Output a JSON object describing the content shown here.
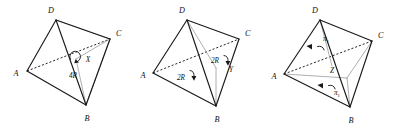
{
  "figure": {
    "caption": "",
    "background_color": "#ffffff",
    "line_color": "#1a1a1a",
    "light_line_color": "#9a9a9a",
    "count": 3
  },
  "panels": [
    {
      "id": "panel-1",
      "vertices": [
        {
          "name": "A",
          "label": "A"
        },
        {
          "name": "B",
          "label": "B"
        },
        {
          "name": "C",
          "label": "C"
        },
        {
          "name": "D",
          "label": "D"
        }
      ],
      "marked_point": "X",
      "rotation_labels": [
        {
          "text": "4R",
          "symbol": "circular-arrow",
          "turn": "full"
        }
      ]
    },
    {
      "id": "panel-2",
      "vertices": [
        {
          "name": "A",
          "label": "A"
        },
        {
          "name": "B",
          "label": "B"
        },
        {
          "name": "C",
          "label": "C"
        },
        {
          "name": "D",
          "label": "D"
        }
      ],
      "marked_point": "Y",
      "rotation_labels": [
        {
          "text": "2R",
          "symbol": "curved-arrow",
          "turn": "half"
        },
        {
          "text": "2R",
          "symbol": "curved-arrow",
          "turn": "half"
        }
      ]
    },
    {
      "id": "panel-3",
      "vertices": [
        {
          "name": "A",
          "label": "A"
        },
        {
          "name": "B",
          "label": "B"
        },
        {
          "name": "C",
          "label": "C"
        },
        {
          "name": "D",
          "label": "D"
        }
      ],
      "marked_point": "Z",
      "rotation_labels": [
        {
          "base": "π",
          "sub": "1",
          "symbol": "curved-arrow-with-tick"
        },
        {
          "base": "π",
          "sub": "1",
          "symbol": "curved-arrow-with-tick"
        }
      ]
    }
  ],
  "labels": {
    "A": "A",
    "B": "B",
    "C": "C",
    "D": "D",
    "X": "X",
    "Y": "Y",
    "Z": "Z",
    "four_r": "4R",
    "two_r": "2R",
    "pi_base": "π",
    "pi_sub": "1"
  }
}
